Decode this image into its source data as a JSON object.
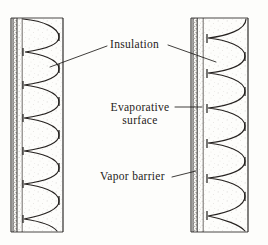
{
  "figure": {
    "kind": "wall-section-diagram",
    "background_color": "#fdfdfb",
    "ink_color": "#1d1b19",
    "stipple_color": "#4a4540",
    "labels": [
      {
        "id": "insulation",
        "text": "Insulation",
        "leaders": [
          "left",
          "right"
        ]
      },
      {
        "id": "evaporative",
        "line1": "Evaporative",
        "line2": "surface",
        "leaders": [
          "right"
        ]
      },
      {
        "id": "vapor",
        "text": "Vapor barrier",
        "leaders": [
          "right"
        ]
      }
    ],
    "assemblies": [
      {
        "id": "left-wall",
        "outer_face_x": 11,
        "inner_face_x": 63,
        "top_y": 18,
        "bottom_y": 232,
        "vapor_barrier_x": 16,
        "evaporative_surface_x": 22,
        "insulation_lobes": 6
      },
      {
        "id": "right-wall",
        "outer_face_x": 191,
        "inner_face_x": 248,
        "top_y": 18,
        "bottom_y": 232,
        "vapor_barrier_x": 196,
        "evaporative_surface_x": 203,
        "insulation_lobes": 6
      }
    ]
  }
}
